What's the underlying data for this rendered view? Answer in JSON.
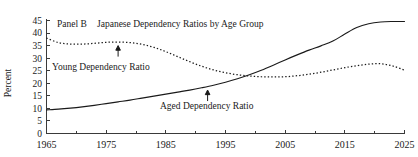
{
  "figure": {
    "panel_label": "Panel B",
    "title": "Japanese Dependency Ratios by Age Group",
    "ylabel": "Percent"
  },
  "chart_data": {
    "type": "line",
    "xlabel": "",
    "ylabel": "Percent",
    "xlim": [
      1965,
      2025
    ],
    "ylim": [
      0,
      45
    ],
    "grid": false,
    "legend": "inline-annotated",
    "xticks": [
      1965,
      1975,
      1985,
      1995,
      2005,
      2015,
      2025
    ],
    "xtick_labels": [
      "1965",
      "1975",
      "1985",
      "1995",
      "2005",
      "2015",
      "2025"
    ],
    "xminor_ticks": [
      1970,
      1980,
      1990,
      2000,
      2010,
      2020
    ],
    "yticks": [
      0,
      5,
      10,
      15,
      20,
      25,
      30,
      35,
      40,
      45
    ],
    "ytick_labels": [
      "0",
      "5",
      "10",
      "15",
      "20",
      "25",
      "30",
      "35",
      "40",
      "45"
    ],
    "x": [
      1965,
      1967,
      1969,
      1971,
      1973,
      1975,
      1977,
      1979,
      1981,
      1983,
      1985,
      1987,
      1989,
      1991,
      1993,
      1995,
      1997,
      1999,
      2001,
      2003,
      2005,
      2007,
      2009,
      2011,
      2013,
      2015,
      2017,
      2019,
      2021,
      2023,
      2025
    ],
    "series": [
      {
        "name": "Young Dependency Ratio",
        "style": "dotted",
        "annotation_year": 1977,
        "values": [
          38.0,
          36.2,
          35.6,
          35.6,
          35.9,
          36.3,
          36.4,
          36.2,
          35.5,
          34.3,
          32.6,
          30.6,
          28.6,
          26.8,
          25.3,
          24.2,
          23.4,
          22.9,
          22.6,
          22.5,
          22.6,
          23.0,
          23.6,
          24.4,
          25.3,
          26.2,
          27.0,
          27.6,
          27.8,
          26.9,
          25.2
        ]
      },
      {
        "name": "Aged Dependency Ratio",
        "style": "solid",
        "annotation_year": 1992,
        "values": [
          9.4,
          9.7,
          10.1,
          10.6,
          11.2,
          11.9,
          12.6,
          13.3,
          14.1,
          14.9,
          15.7,
          16.5,
          17.3,
          18.2,
          19.2,
          20.4,
          21.8,
          23.4,
          25.2,
          27.2,
          29.3,
          31.3,
          33.2,
          34.9,
          36.8,
          39.6,
          42.2,
          43.7,
          44.4,
          44.6,
          44.6
        ]
      }
    ]
  }
}
